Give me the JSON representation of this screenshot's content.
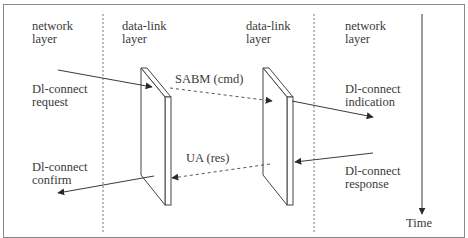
{
  "columns": [
    {
      "line1": "network",
      "line2": "layer"
    },
    {
      "line1": "data-link",
      "line2": "layer"
    },
    {
      "line1": "data-link",
      "line2": "layer"
    },
    {
      "line1": "network",
      "line2": "layer"
    }
  ],
  "primitives": {
    "request": {
      "line1": "Dl-connect",
      "line2": "request"
    },
    "indication": {
      "line1": "Dl-connect",
      "line2": "indication"
    },
    "response": {
      "line1": "Dl-connect",
      "line2": "response"
    },
    "confirm": {
      "line1": "Dl-connect",
      "line2": "confirm"
    }
  },
  "frames": {
    "sabm": "SABM (cmd)",
    "ua": "UA (res)"
  },
  "time_axis": {
    "label": "Time"
  },
  "colors": {
    "line": "#3a3a3a",
    "frame": "#8a8a8a",
    "panel_border": "#555555"
  }
}
